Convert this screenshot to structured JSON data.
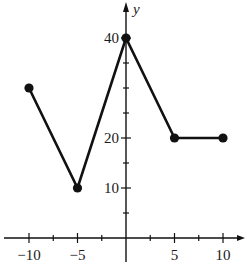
{
  "chart_data": {
    "type": "line",
    "title": "",
    "xlabel": "",
    "ylabel": "y",
    "x": [
      -10,
      -5,
      0,
      5,
      10
    ],
    "series": [
      {
        "name": "f",
        "values": [
          30,
          10,
          40,
          20,
          20
        ]
      }
    ],
    "points": [
      {
        "x": -10,
        "y": 30
      },
      {
        "x": -5,
        "y": 10
      },
      {
        "x": 0,
        "y": 40
      },
      {
        "x": 5,
        "y": 20
      },
      {
        "x": 10,
        "y": 20
      }
    ],
    "x_tick_labels": [
      "−10",
      "−5",
      "5",
      "10"
    ],
    "x_tick_label_values": [
      -10,
      -5,
      5,
      10
    ],
    "x_minor_ticks": [
      -10,
      -7.5,
      -5,
      -2.5,
      2.5,
      5,
      7.5,
      10
    ],
    "y_tick_labels": [
      "10",
      "20",
      "40"
    ],
    "y_tick_label_values": [
      10,
      20,
      40
    ],
    "y_minor_ticks": [
      5,
      10,
      15,
      20,
      25,
      30,
      35,
      40
    ],
    "xlim": [
      -12.5,
      12.5
    ],
    "ylim": [
      -6,
      46
    ],
    "grid": false,
    "legend": "none",
    "markers": "filled-circle",
    "line_color": "#111111"
  }
}
